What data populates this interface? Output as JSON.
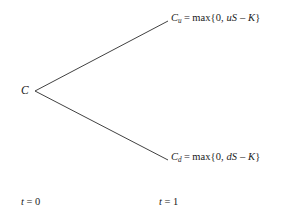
{
  "figure": {
    "type": "binomial-tree",
    "background_color": "#ffffff",
    "line_color": "#2b2b2b",
    "text_color": "#1a1a1a"
  },
  "nodes": {
    "root": {
      "label": "C",
      "x": 32,
      "y": 91
    },
    "up": {
      "symbol": "C",
      "subscript": "u",
      "equals": "=",
      "function": "max",
      "open_brace": "{",
      "first_arg": "0",
      "comma": ",",
      "factor": "u",
      "spot": "S",
      "minus": "–",
      "strike": "K",
      "close_brace": "}",
      "full_text": "C_u = max{0, uS – K}",
      "x": 171,
      "y": 21
    },
    "down": {
      "symbol": "C",
      "subscript": "d",
      "equals": "=",
      "function": "max",
      "open_brace": "{",
      "first_arg": "0",
      "comma": ",",
      "factor": "d",
      "spot": "S",
      "minus": "–",
      "strike": "K",
      "close_brace": "}",
      "full_text": "C_d = max{0, dS – K}",
      "x": 171,
      "y": 160
    }
  },
  "branches": [
    {
      "name": "up-branch",
      "x1": 35,
      "y1": 91,
      "x2": 168,
      "y2": 21
    },
    {
      "name": "down-branch",
      "x1": 35,
      "y1": 91,
      "x2": 168,
      "y2": 160
    }
  ],
  "time_axis": {
    "start": {
      "variable": "t",
      "equals": "=",
      "value": "0",
      "full_text": "t = 0"
    },
    "end": {
      "variable": "t",
      "equals": "=",
      "value": "1",
      "full_text": "t = 1"
    }
  }
}
